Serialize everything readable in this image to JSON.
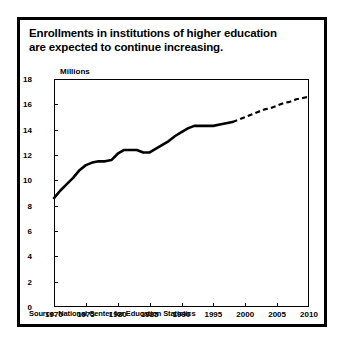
{
  "figure": {
    "title_line_1": "Enrollments in institutions of higher education",
    "title_line_2": "are expected to continue increasing.",
    "units_label": "Millions",
    "source": "Source: National Center for Education Statistics"
  },
  "colors": {
    "line": "#000000",
    "frame": "#000000",
    "background": "#ffffff"
  },
  "chart_data": {
    "type": "line",
    "title": "Enrollments in institutions of higher education are expected to continue increasing.",
    "xlabel": "",
    "ylabel": "Millions",
    "xlim": [
      1970,
      2010
    ],
    "ylim": [
      0,
      18
    ],
    "xticks": [
      1970,
      1975,
      1980,
      1985,
      1990,
      1995,
      2000,
      2005,
      2010
    ],
    "yticks": [
      0,
      2,
      4,
      6,
      8,
      10,
      12,
      14,
      16,
      18
    ],
    "grid": false,
    "legend": "none",
    "series": [
      {
        "name": "Actual enrollment",
        "style": "solid",
        "x": [
          1970,
          1971,
          1972,
          1973,
          1974,
          1975,
          1976,
          1977,
          1978,
          1979,
          1980,
          1981,
          1982,
          1983,
          1984,
          1985,
          1986,
          1987,
          1988,
          1989,
          1990,
          1991,
          1992,
          1993,
          1994,
          1995,
          1996,
          1997,
          1998
        ],
        "values": [
          8.6,
          9.2,
          9.7,
          10.2,
          10.8,
          11.2,
          11.4,
          11.5,
          11.5,
          11.6,
          12.1,
          12.4,
          12.4,
          12.4,
          12.2,
          12.2,
          12.5,
          12.8,
          13.1,
          13.5,
          13.8,
          14.1,
          14.3,
          14.3,
          14.3,
          14.3,
          14.4,
          14.5,
          14.6
        ]
      },
      {
        "name": "Projected enrollment",
        "style": "dashed",
        "x": [
          1998,
          1999,
          2000,
          2001,
          2002,
          2003,
          2004,
          2005,
          2006,
          2007,
          2008,
          2009,
          2010
        ],
        "values": [
          14.6,
          14.8,
          15.0,
          15.2,
          15.4,
          15.6,
          15.7,
          15.9,
          16.1,
          16.2,
          16.4,
          16.5,
          16.6
        ]
      }
    ]
  }
}
